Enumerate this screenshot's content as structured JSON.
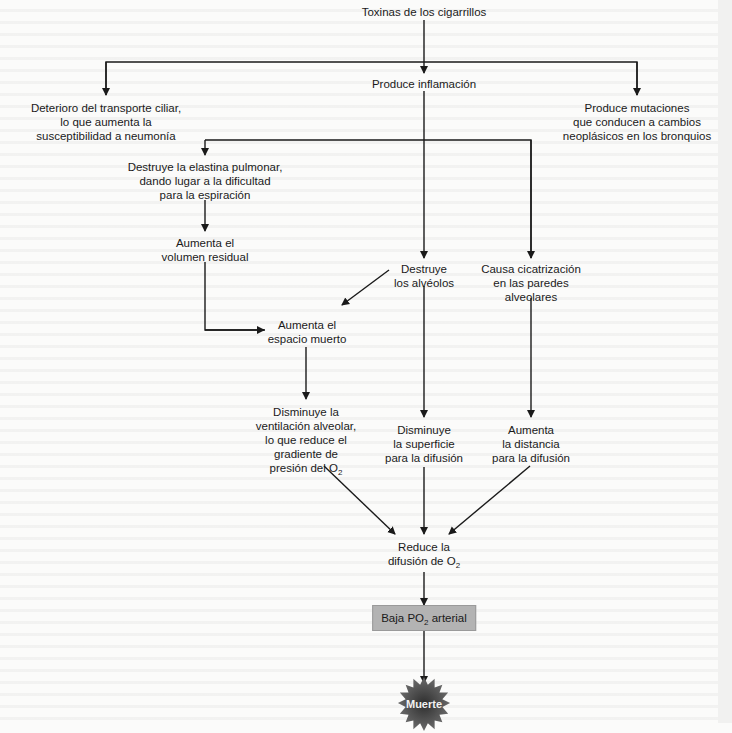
{
  "diagram": {
    "root": "Toxinas de los cigarrillos",
    "level1": {
      "left": [
        "Deterioro del transporte ciliar,",
        "lo que aumenta la",
        "susceptibilidad a neumonía"
      ],
      "center": "Produce inflamación",
      "right": [
        "Produce mutaciones",
        "que conducen a cambios",
        "neoplásicos en los bronquios"
      ]
    },
    "inflammation_branches": {
      "elastin": [
        "Destruye la elastina pulmonar,",
        "dando lugar a la dificultad",
        "para la espiración"
      ],
      "residual_volume": [
        "Aumenta el",
        "volumen residual"
      ],
      "alveoli": [
        "Destruye",
        "los alvéolos"
      ],
      "scarring": [
        "Causa cicatrización",
        "en las paredes",
        "alveolares"
      ]
    },
    "dead_space": [
      "Aumenta el",
      "espacio muerto"
    ],
    "ventilation": [
      "Disminuye la",
      "ventilación alveolar,",
      "lo que reduce el",
      "gradiente de",
      "presión del O",
      "2"
    ],
    "surface": [
      "Disminuye",
      "la superficie",
      "para la difusión"
    ],
    "distance": [
      "Aumenta",
      "la distancia",
      "para la difusión"
    ],
    "reduce_diffusion": [
      "Reduce la",
      "difusión de O",
      "2"
    ],
    "low_po2": {
      "pre": "Baja PO",
      "sub": "2",
      "post": " arterial"
    },
    "death": "Muerte",
    "colors": {
      "line": "#1a1a1a",
      "box_fill": "#b3b3b3",
      "burst_fill": "#4a4a4a",
      "background": "#fbfbfa"
    }
  }
}
